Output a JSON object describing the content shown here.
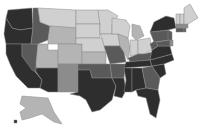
{
  "map": {
    "type": "choropleth",
    "region": "United States",
    "colorScale": {
      "1": "#d0d0d0",
      "2": "#b4b4b4",
      "3": "#8c8c8c",
      "4": "#5a5a5a",
      "5": "#2e2e2e"
    },
    "states": [
      {
        "id": "WA",
        "level": 5,
        "points": "8,10 32,8 33,28 20,30 12,28 6,18"
      },
      {
        "id": "OR",
        "level": 5,
        "points": "6,18 12,28 20,30 33,28 31,44 6,44 4,34"
      },
      {
        "id": "CA",
        "level": 5,
        "points": "6,44 22,44 22,56 42,80 40,88 28,88 16,76 10,64 6,54"
      },
      {
        "id": "NV",
        "level": 4,
        "points": "22,44 38,44 36,72 32,70 22,56"
      },
      {
        "id": "ID",
        "level": 4,
        "points": "33,8 38,8 40,22 50,26 48,40 38,44 31,44 33,28"
      },
      {
        "id": "MT",
        "level": 1,
        "points": "38,8 76,10 76,28 50,26 40,22"
      },
      {
        "id": "WY",
        "level": 2,
        "points": "50,26 76,28 76,44 48,44 48,40"
      },
      {
        "id": "UT",
        "level": 2,
        "points": "38,44 48,44 48,50 58,50 58,68 36,68 36,62"
      },
      {
        "id": "AZ",
        "level": 5,
        "points": "36,68 58,68 58,92 48,92 40,88 42,80 36,72"
      },
      {
        "id": "CO",
        "level": 2,
        "points": "58,44 82,44 82,64 58,64"
      },
      {
        "id": "NM",
        "level": 3,
        "points": "58,64 78,64 78,92 58,92"
      },
      {
        "id": "ND",
        "level": 1,
        "points": "76,10 98,10 100,24 76,24"
      },
      {
        "id": "SD",
        "level": 1,
        "points": "76,24 100,24 100,38 76,38"
      },
      {
        "id": "NE",
        "level": 1,
        "points": "76,38 102,38 106,52 82,52 82,44 76,44"
      },
      {
        "id": "KS",
        "level": 2,
        "points": "82,52 106,52 106,64 82,64"
      },
      {
        "id": "OK",
        "level": 4,
        "points": "78,64 110,64 112,78 92,78 90,70 78,70"
      },
      {
        "id": "TX",
        "level": 5,
        "points": "78,70 90,70 92,78 112,78 116,86 112,100 100,110 92,112 86,100 80,96 70,94 78,92"
      },
      {
        "id": "MN",
        "level": 1,
        "points": "98,10 108,10 118,16 112,24 112,34 100,34 100,24"
      },
      {
        "id": "IA",
        "level": 1,
        "points": "100,34 118,34 120,46 104,46 102,38"
      },
      {
        "id": "MO",
        "level": 4,
        "points": "104,46 120,46 124,52 126,62 110,64 106,52"
      },
      {
        "id": "AR",
        "level": 4,
        "points": "110,64 126,64 124,78 112,78"
      },
      {
        "id": "LA",
        "level": 5,
        "points": "112,78 124,78 126,90 122,98 114,96 116,86"
      },
      {
        "id": "WI",
        "level": 1,
        "points": "112,18 126,20 130,26 128,38 118,34 112,34 112,24"
      },
      {
        "id": "IL",
        "level": 2,
        "points": "118,34 128,38 130,48 128,60 124,52 120,46"
      },
      {
        "id": "MI",
        "level": 2,
        "points": "132,24 140,26 144,36 136,40 132,36"
      },
      {
        "id": "IN",
        "level": 1,
        "points": "130,40 138,40 138,54 130,56 130,48"
      },
      {
        "id": "OH",
        "level": 1,
        "points": "138,40 150,38 152,50 144,54 138,54"
      },
      {
        "id": "KY",
        "level": 4,
        "points": "128,58 138,54 144,54 152,52 150,60 130,62"
      },
      {
        "id": "TN",
        "level": 5,
        "points": "126,62 150,60 152,66 124,68"
      },
      {
        "id": "MS",
        "level": 5,
        "points": "124,68 132,68 132,92 124,92 126,80"
      },
      {
        "id": "AL",
        "level": 5,
        "points": "132,68 142,68 146,88 136,90 132,92"
      },
      {
        "id": "GA",
        "level": 4,
        "points": "142,68 152,66 160,78 158,90 146,88"
      },
      {
        "id": "FL",
        "level": 5,
        "points": "136,90 146,88 158,90 160,100 156,118 150,114 146,98 138,96"
      },
      {
        "id": "SC",
        "level": 5,
        "points": "152,66 164,64 166,74 160,78"
      },
      {
        "id": "NC",
        "level": 5,
        "points": "150,60 172,54 174,60 164,64 152,66"
      },
      {
        "id": "VA",
        "level": 5,
        "points": "152,50 158,46 170,46 172,54 150,60"
      },
      {
        "id": "WV",
        "level": 4,
        "points": "150,44 156,40 158,46 152,50"
      },
      {
        "id": "PA",
        "level": 4,
        "points": "150,32 168,30 170,40 154,42"
      },
      {
        "id": "NY",
        "level": 5,
        "points": "154,22 166,16 174,18 176,28 168,30 150,32"
      },
      {
        "id": "NJ",
        "level": 4,
        "points": "168,30 172,32 172,42 168,40"
      },
      {
        "id": "MD",
        "level": 4,
        "points": "156,42 170,40 170,46 158,46"
      },
      {
        "id": "DE",
        "level": 3,
        "points": "170,40 173,40 173,46 170,46"
      },
      {
        "id": "CT",
        "level": 4,
        "points": "176,28 184,28 184,32 176,32"
      },
      {
        "id": "RI",
        "level": 4,
        "points": "184,28 186,28 186,32 184,32"
      },
      {
        "id": "MA",
        "level": 3,
        "points": "176,24 188,24 188,28 176,28"
      },
      {
        "id": "VT",
        "level": 1,
        "points": "176,14 180,14 180,24 176,24"
      },
      {
        "id": "NH",
        "level": 1,
        "points": "180,14 184,14 184,24 180,24"
      },
      {
        "id": "ME",
        "level": 1,
        "points": "184,8 190,4 198,18 188,24 184,24 184,14"
      },
      {
        "id": "AK",
        "level": 2,
        "points": "22,96 48,98 54,112 62,124 54,122 42,114 30,118 22,120 20,112 26,108 20,104"
      },
      {
        "id": "HI",
        "level": 5,
        "points": "14,120 17,120 17,123 14,123"
      }
    ]
  }
}
